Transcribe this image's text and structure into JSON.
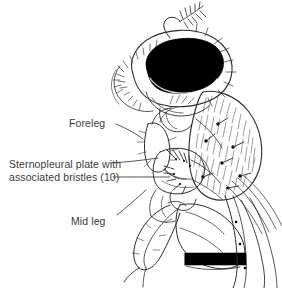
{
  "figure": {
    "background_color": "#ffffff",
    "ink_color": "#2b2b2b",
    "label_color": "#3a3a3a",
    "fill_black": "#000000",
    "width": 282,
    "height": 288
  },
  "labels": [
    {
      "id": "foreleg",
      "text": "Foreleg",
      "lines": [
        "Foreleg"
      ],
      "x": 69,
      "y": 117,
      "leader": "single"
    },
    {
      "id": "sternopleural",
      "text": "Sternopleural plate with associated bristles (10)",
      "lines": [
        "Sternopleural plate with",
        "associated bristles (10)"
      ],
      "x": 9,
      "y": 158,
      "leader": "double",
      "bristle_count": "10"
    },
    {
      "id": "midleg",
      "text": "Mid leg",
      "lines": [
        "Mid leg"
      ],
      "x": 71,
      "y": 215,
      "leader": "single"
    }
  ],
  "anatomy": {
    "eye": "compound-eye",
    "arista": "feathered-arista",
    "thorax": "hatched-scutum",
    "abdomen_band": "black-abdominal-band",
    "legs": [
      "foreleg",
      "mid-leg",
      "hind-leg"
    ]
  }
}
